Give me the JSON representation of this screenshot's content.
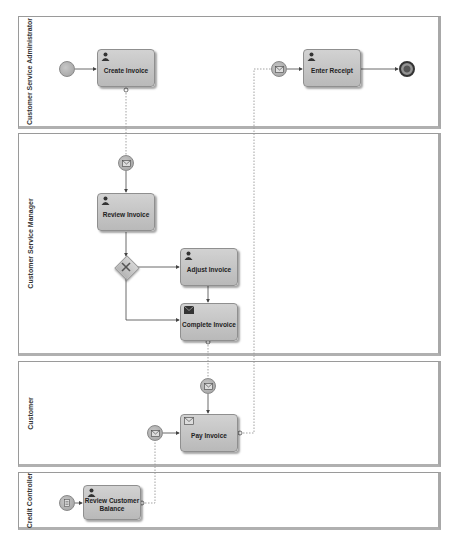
{
  "lanes": [
    {
      "label": "Customer Service Administrator"
    },
    {
      "label": "Customer Service Manager"
    },
    {
      "label": "Customer"
    },
    {
      "label": "Credit Controller"
    }
  ],
  "tasks": {
    "create_invoice": "Create Invoice",
    "enter_receipt": "Enter Receipt",
    "review_invoice": "Review Invoice",
    "adjust_invoice": "Adjust Invoice",
    "complete_invoice": "Complete Invoice",
    "pay_invoice": "Pay Invoice",
    "review_customer_balance": "Review Customer Balance"
  },
  "icons": {
    "user_task": "user-icon",
    "send_task": "envelope-icon",
    "message_event": "envelope-icon",
    "gateway": "x-icon",
    "conditional_event": "document-icon"
  },
  "colors": {
    "task_fill": "#c6c6c6",
    "task_border": "#8f8f8f",
    "lane_border": "#9a9a9a",
    "flow_line": "#444444",
    "message_line": "#9a9a9a"
  }
}
